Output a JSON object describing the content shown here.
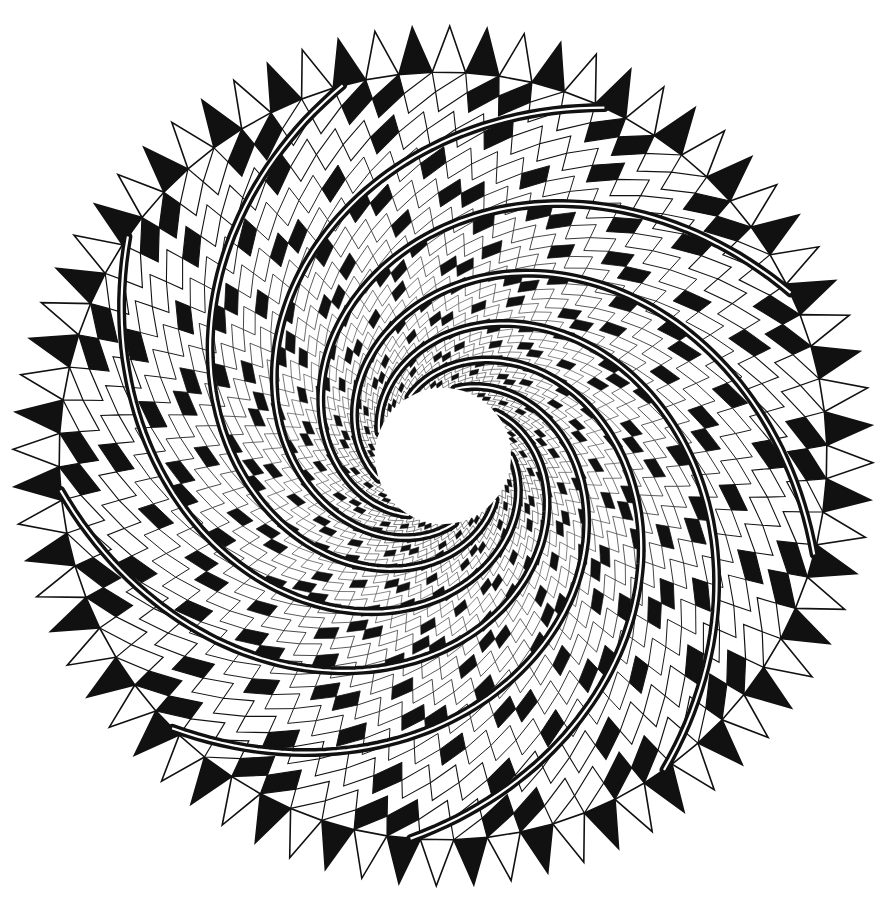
{
  "artwork": {
    "title": "Spiral triangle mandala",
    "type": "black-and-white geometric line art",
    "center": [
      443,
      456
    ],
    "outer_radius": 430,
    "inner_hole_radius": 68,
    "tooth_count": 72,
    "tooth_depth": 46,
    "lattice_rings": 16,
    "spiral_band_count": 9,
    "spiral_twist": 1.15,
    "colors": {
      "ink": "#111111",
      "paper": "#ffffff"
    }
  },
  "caption": {
    "text": ""
  }
}
